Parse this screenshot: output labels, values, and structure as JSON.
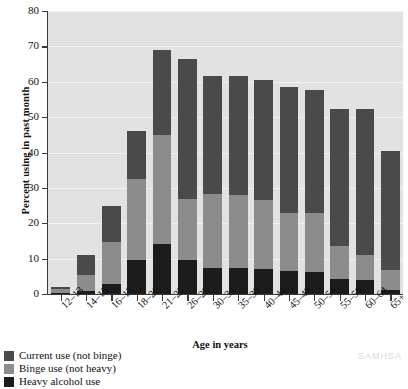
{
  "chart_data": {
    "type": "bar",
    "stacked": true,
    "title": "",
    "xlabel": "Age in years",
    "ylabel": "Percent using in past month",
    "ylim": [
      0,
      80
    ],
    "yticks": [
      0,
      10,
      20,
      30,
      40,
      50,
      60,
      70,
      80
    ],
    "grid": true,
    "legend_position": "below-left",
    "categories": [
      "12–13",
      "14–15",
      "16–17",
      "18–20",
      "21–25",
      "26–29",
      "30–34",
      "35–39",
      "40–44",
      "45–49",
      "50–54",
      "55–59",
      "60–64",
      "65+"
    ],
    "series": [
      {
        "name": "Heavy alcohol use",
        "color": "#1c1c1c",
        "values": [
          0.3,
          0.8,
          2.8,
          9.5,
          14.0,
          9.5,
          7.3,
          7.3,
          7.0,
          6.6,
          6.3,
          4.2,
          4.0,
          1.2
        ]
      },
      {
        "name": "Binge use (not heavy)",
        "color": "#8c8c8c",
        "values": [
          1.2,
          4.6,
          12.0,
          23.0,
          31.0,
          17.5,
          21.0,
          20.7,
          19.5,
          16.2,
          16.5,
          9.3,
          7.0,
          5.6
        ]
      },
      {
        "name": "Current use (not binge)",
        "color": "#4a4a4a",
        "values": [
          0.5,
          5.6,
          10.2,
          13.5,
          24.0,
          39.5,
          33.4,
          33.7,
          34.0,
          35.7,
          35.0,
          38.8,
          41.2,
          33.5
        ]
      }
    ],
    "totals": [
      2.0,
      11.0,
      25.0,
      46.0,
      69.0,
      66.5,
      61.7,
      61.7,
      60.5,
      58.5,
      57.8,
      52.3,
      52.2,
      40.3
    ]
  },
  "legend": {
    "items": [
      {
        "label": "Current use (not binge)",
        "color": "#4a4a4a"
      },
      {
        "label": "Binge use (not heavy)",
        "color": "#8c8c8c"
      },
      {
        "label": "Heavy alcohol use",
        "color": "#1c1c1c"
      }
    ]
  },
  "watermark": "SAMHSA"
}
